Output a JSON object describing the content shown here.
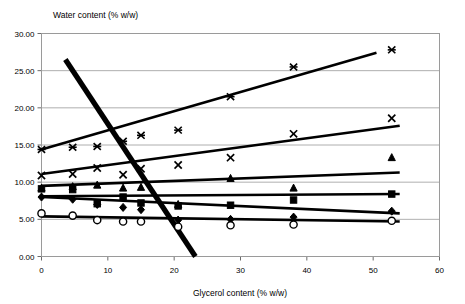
{
  "chart_data": {
    "type": "scatter",
    "title": "",
    "xlabel": "Glycerol content (% w/w)",
    "ylabel": "Water content (% w/w)",
    "xlim": [
      0,
      60
    ],
    "ylim": [
      0,
      30
    ],
    "xticks": [
      "0",
      "10",
      "20",
      "30",
      "40",
      "50",
      "60"
    ],
    "yticks": [
      "0.00",
      "5.00",
      "10.00",
      "15.00",
      "20.00",
      "25.00",
      "30.00"
    ],
    "xtick_values": [
      0,
      10,
      20,
      30,
      40,
      50,
      60
    ],
    "ytick_values": [
      0,
      5,
      10,
      15,
      20,
      25,
      30
    ],
    "grid": "horizontal",
    "legend": "none",
    "series": [
      {
        "name": "series-asterisk",
        "marker": "asterisk",
        "x": [
          0,
          4.7,
          8.4,
          12.3,
          15.0,
          20.6,
          28.5,
          38.0,
          52.8
        ],
        "y": [
          14.4,
          14.7,
          14.8,
          15.5,
          16.3,
          17.0,
          21.5,
          25.5,
          27.8
        ],
        "trendline": {
          "x0": 0,
          "y0": 14.4,
          "x1": 50.5,
          "y1": 27.4
        }
      },
      {
        "name": "series-cross",
        "marker": "cross",
        "x": [
          0,
          4.7,
          8.4,
          12.3,
          15.0,
          20.6,
          28.5,
          38.0,
          52.8
        ],
        "y": [
          10.9,
          11.1,
          11.9,
          11.0,
          11.8,
          12.3,
          13.3,
          16.5,
          18.6
        ],
        "trendline": {
          "x0": 0,
          "y0": 11.1,
          "x1": 54.0,
          "y1": 17.6
        }
      },
      {
        "name": "series-triangle",
        "marker": "triangle",
        "x": [
          0,
          4.7,
          8.4,
          12.3,
          15.0,
          20.6,
          28.5,
          38.0,
          52.8
        ],
        "y": [
          9.2,
          9.4,
          9.6,
          9.2,
          9.3,
          7.0,
          10.5,
          9.2,
          13.3
        ],
        "trendline": {
          "x0": 0,
          "y0": 9.5,
          "x1": 54.0,
          "y1": 11.3
        }
      },
      {
        "name": "series-square",
        "marker": "square",
        "x": [
          0,
          4.7,
          8.4,
          12.3,
          15.0,
          20.6,
          28.5,
          38.0,
          52.8
        ],
        "y": [
          9.1,
          9.0,
          7.1,
          8.0,
          7.2,
          6.8,
          6.9,
          7.6,
          8.4
        ],
        "trendline": {
          "x0": 0,
          "y0": 8.1,
          "x1": 54.0,
          "y1": 8.4
        }
      },
      {
        "name": "series-diamond",
        "marker": "diamond",
        "x": [
          0,
          4.7,
          8.4,
          12.3,
          15.0,
          20.6,
          28.5,
          38.0,
          52.8
        ],
        "y": [
          8.0,
          7.7,
          7.0,
          6.6,
          6.3,
          4.9,
          5.0,
          5.3,
          6.1
        ],
        "trendline": {
          "x0": 0,
          "y0": 8.0,
          "x1": 54.0,
          "y1": 5.8
        }
      },
      {
        "name": "series-circle",
        "marker": "circle",
        "x": [
          0,
          4.7,
          8.4,
          12.3,
          15.0,
          20.6,
          28.5,
          38.0,
          52.8
        ],
        "y": [
          5.8,
          5.5,
          4.9,
          4.7,
          4.7,
          4.0,
          4.2,
          4.3,
          4.8
        ],
        "trendline": {
          "x0": 0,
          "y0": 5.4,
          "x1": 54.0,
          "y1": 4.7
        }
      }
    ],
    "extra_lines": [
      {
        "name": "descending-reference-line",
        "x0": 3.6,
        "y0": 26.5,
        "x1": 23.2,
        "y1": 0.0,
        "width": "thick"
      }
    ]
  }
}
